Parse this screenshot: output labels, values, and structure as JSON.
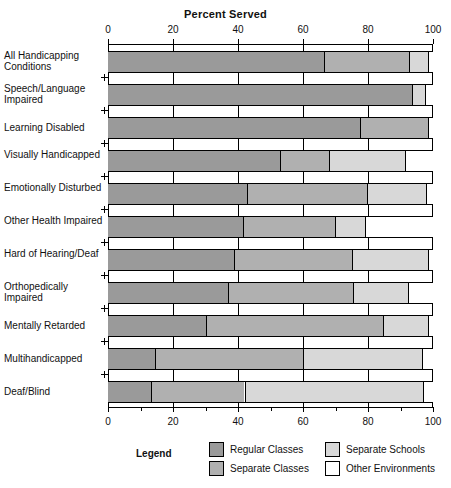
{
  "chart_data": {
    "type": "bar",
    "orientation": "horizontal",
    "stacked": true,
    "title": "Percent Served",
    "xlabel": "",
    "ylabel": "",
    "xlim": [
      0,
      100
    ],
    "xticks": [
      0,
      20,
      40,
      60,
      80,
      100
    ],
    "xtick_labels": [
      "0",
      "20",
      "40",
      "60",
      "80",
      "100"
    ],
    "xticks_top": true,
    "xticks_bottom": true,
    "grid": true,
    "legend_position": "bottom",
    "legend_title": "Legend",
    "categories": [
      "All Handicapping Conditions",
      "Speech/Language Impaired",
      "Learning Disabled",
      "Visually Handicapped",
      "Emotionally Disturbed",
      "Other Health Impaired",
      "Hard of Hearing/Deaf",
      "Orthopedically Impaired",
      "Mentally Retarded",
      "Multihandicapped",
      "Deaf/Blind"
    ],
    "series": [
      {
        "name": "Regular Classes",
        "color": "#9a9a9a",
        "values": [
          66.5,
          93.5,
          77.5,
          53.0,
          42.8,
          41.5,
          38.8,
          37.0,
          30.0,
          14.5,
          13.2
        ]
      },
      {
        "name": "Separate Classes",
        "color": "#b0b0b0",
        "values": [
          26.1,
          0.0,
          21.0,
          15.0,
          36.9,
          28.3,
          36.2,
          38.4,
          54.6,
          45.5,
          28.8
        ]
      },
      {
        "name": "Separate Schools",
        "color": "#d8d8d8",
        "values": [
          5.9,
          4.0,
          0.0,
          23.4,
          18.2,
          9.2,
          23.5,
          16.9,
          13.9,
          36.6,
          55.0
        ]
      },
      {
        "name": "Other Environments",
        "color": "#ffffff",
        "values": [
          1.5,
          2.5,
          1.5,
          8.6,
          2.1,
          21.0,
          1.5,
          7.7,
          1.5,
          3.4,
          3.0
        ]
      }
    ]
  },
  "legend": {
    "title": "Legend",
    "items": [
      {
        "label": "Regular Classes",
        "color": "#9a9a9a"
      },
      {
        "label": "Separate Classes",
        "color": "#b0b0b0"
      },
      {
        "label": "Separate Schools",
        "color": "#d8d8d8"
      },
      {
        "label": "Other Environments",
        "color": "#ffffff"
      }
    ]
  }
}
